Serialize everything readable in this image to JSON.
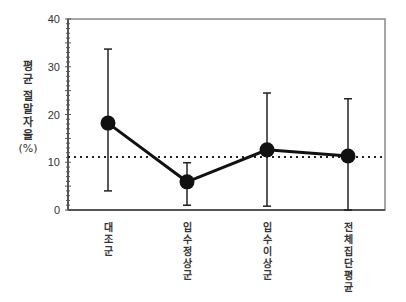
{
  "chart_data": {
    "type": "line",
    "title": "",
    "xlabel": "",
    "ylabel": "평균 절말자율 (%)",
    "ylabel_text": "평균 절말자율",
    "ylabel_unit": "(%)",
    "ylim": [
      0,
      40
    ],
    "yticks": [
      0,
      10,
      20,
      30,
      40
    ],
    "grid": false,
    "legend": null,
    "categories": [
      "대조군",
      "입수정상군",
      "입수이상군",
      "전체집단평균"
    ],
    "series": [
      {
        "name": "평균 절말자율",
        "values": [
          18.2,
          5.9,
          12.6,
          11.3
        ],
        "error_upper": [
          33.7,
          9.9,
          24.5,
          23.3
        ],
        "error_lower": [
          4.0,
          1.0,
          0.8,
          0.0
        ]
      }
    ],
    "reference_line": {
      "style": "dotted",
      "value": 11.1
    }
  },
  "colors": {
    "line": "#111111",
    "axis": "#555555",
    "text": "#333333"
  }
}
